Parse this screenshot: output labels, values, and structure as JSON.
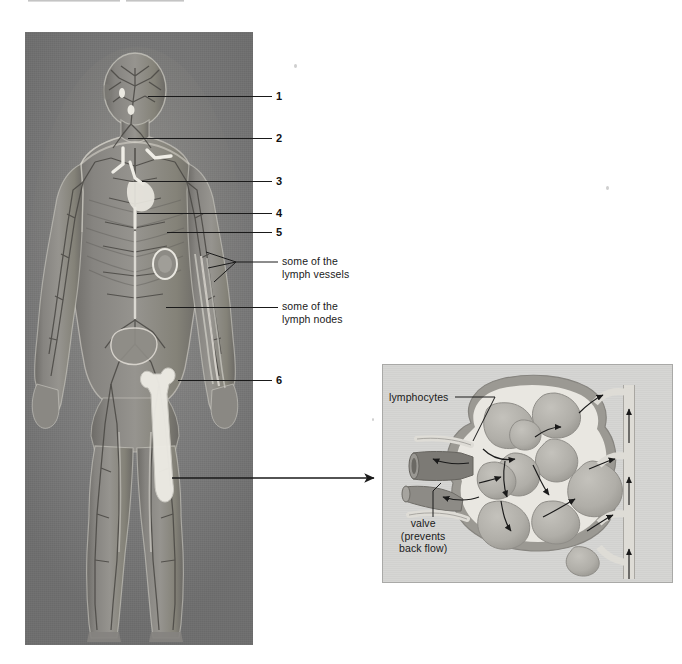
{
  "figure": {
    "kind": "anatomical-diagram",
    "panels": [
      "body-panel",
      "lymph-node-inset"
    ]
  },
  "colors": {
    "page_background": "#ffffff",
    "body_panel_background": "#7e7e7e",
    "body_panel_highlight": "#8d8d8d",
    "body_panel_shadow": "#6e6e6e",
    "inset_background": "#d5d5d3",
    "inset_border": "#a9a9a7",
    "vessel_light": "#e8e6e0",
    "vessel_mid": "#b9b7b1",
    "vessel_dark": "#5e5c58",
    "leader_line": "#1a1a1a",
    "label_text": "#1a1a1a",
    "node_fill": "#b2b0ab",
    "node_outline": "#8f8d88"
  },
  "body_panel": {
    "name": "human-body-lymphatic-illustration",
    "description": "Full-length anterior view of a human male figure showing the lymphatic vessels and nodes",
    "bounds": {
      "x": 25,
      "y": 32,
      "width": 228,
      "height": 613
    }
  },
  "callouts": [
    {
      "id": "1",
      "label": "1",
      "type": "number",
      "leader_y": 96,
      "leader_x_start": 148,
      "leader_x_end": 272,
      "text_x": 276,
      "text_y": 91
    },
    {
      "id": "2",
      "label": "2",
      "type": "number",
      "leader_y": 138,
      "leader_x_start": 128,
      "leader_x_end": 272,
      "text_x": 276,
      "text_y": 133
    },
    {
      "id": "3",
      "label": "3",
      "type": "number",
      "leader_y": 181,
      "leader_x_start": 142,
      "leader_x_end": 272,
      "text_x": 276,
      "text_y": 176
    },
    {
      "id": "4",
      "label": "4",
      "type": "number",
      "leader_y": 213,
      "leader_x_start": 137,
      "leader_x_end": 272,
      "text_x": 276,
      "text_y": 208
    },
    {
      "id": "5",
      "label": "5",
      "type": "number",
      "leader_y": 232,
      "leader_x_start": 167,
      "leader_x_end": 272,
      "text_x": 276,
      "text_y": 227
    },
    {
      "id": "6",
      "label": "6",
      "type": "number",
      "leader_y": 380,
      "leader_x_start": 178,
      "leader_x_end": 272,
      "text_x": 276,
      "text_y": 375
    }
  ],
  "text_callouts": [
    {
      "id": "lymph-vessels",
      "label": "some of the\nlymph vessels",
      "leader_y": 262,
      "leader_x_start": 235,
      "leader_x_end": 272,
      "text_x": 276,
      "text_y": 256,
      "fan_targets": [
        {
          "x": 206,
          "y": 252
        },
        {
          "x": 208,
          "y": 268
        },
        {
          "x": 214,
          "y": 282
        }
      ]
    },
    {
      "id": "lymph-nodes",
      "label": "some of the\nlymph nodes",
      "leader_y": 307,
      "leader_x_start": 166,
      "leader_x_end": 272,
      "text_x": 276,
      "text_y": 301
    }
  ],
  "connector": {
    "name": "body-to-inset-arrow",
    "description": "Horizontal arrow pointing from the groin/thigh region of the body to the lymph node inset",
    "from_x": 172,
    "to_x": 382,
    "y": 478
  },
  "inset": {
    "name": "lymph-node-cross-section",
    "title": "Lymph node cross-section",
    "bounds": {
      "x": 382,
      "y": 364,
      "width": 291,
      "height": 219
    },
    "labels": [
      {
        "id": "lymphocytes",
        "label": "lymphocytes",
        "leader": {
          "x1": 72,
          "y1": 32,
          "x2": 104,
          "y2": 32,
          "x3": 104,
          "y3": 32
        }
      },
      {
        "id": "valve",
        "label": "valve\n(prevents\nback flow)",
        "leader": {
          "x1": 50,
          "y1": 120,
          "x2": 50,
          "y2": 148
        }
      }
    ],
    "flow_note": "Arrows indicate direction of lymph flow through the node"
  }
}
